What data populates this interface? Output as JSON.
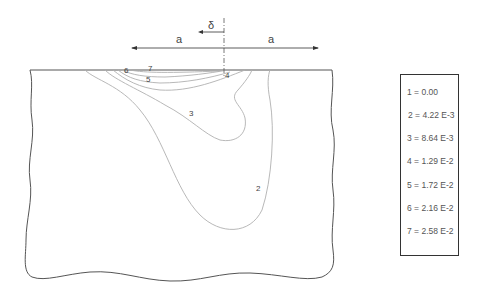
{
  "diagram": {
    "dimension_labels": {
      "delta": "δ",
      "a_left": "a",
      "a_right": "a"
    },
    "contour_labels": {
      "c2": "2",
      "c3": "3",
      "c4": "4",
      "c5": "5",
      "c6": "6",
      "c7": "7"
    }
  },
  "legend": {
    "items": [
      {
        "label": "1 = 0.00"
      },
      {
        "label": "2 = 4.22 E-3"
      },
      {
        "label": "3 = 8.64 E-3"
      },
      {
        "label": "4 = 1.29 E-2"
      },
      {
        "label": "5 = 1.72 E-2"
      },
      {
        "label": "6 = 2.16 E-2"
      },
      {
        "label": "7 = 2.58 E-2"
      }
    ]
  },
  "colors": {
    "outline": "#555555",
    "contour": "#b0b0b0",
    "text": "#444444"
  }
}
